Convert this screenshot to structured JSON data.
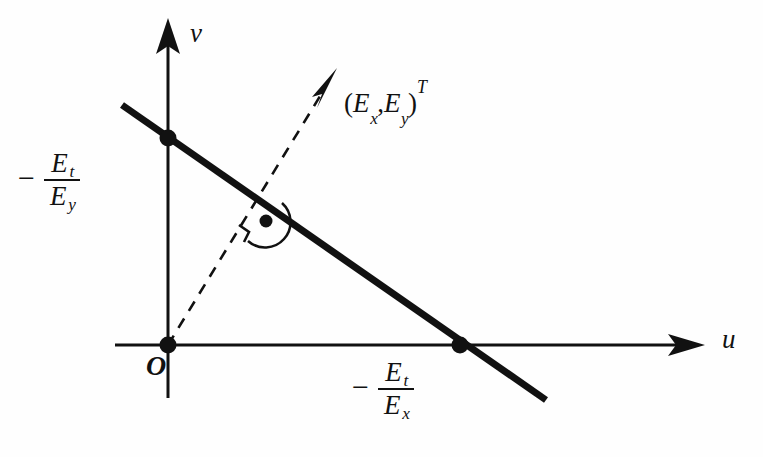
{
  "figure": {
    "type": "diagram",
    "background_color": "#fefefe",
    "ink_color": "#111111"
  },
  "axes": {
    "horizontal": {
      "name": "u",
      "arrow": "right",
      "y_pixel": 345,
      "x_start": 115,
      "x_end": 705,
      "label_position": {
        "x": 722,
        "y": 326
      }
    },
    "vertical": {
      "name": "v",
      "arrow": "up",
      "x_pixel": 168,
      "y_top": 18,
      "y_bottom": 398,
      "label_position": {
        "x": 190,
        "y": 20
      }
    },
    "origin": {
      "label": "O",
      "x": 168,
      "y": 345
    }
  },
  "constraint_line": {
    "name": "optical-flow-constraint-line",
    "style": "solid-thick",
    "stroke_width": 7,
    "x1": 122,
    "y1": 105,
    "x2": 546,
    "y2": 400,
    "slope": -0.696,
    "v_intercept": {
      "x": 168,
      "y": 138
    },
    "u_intercept": {
      "x": 460,
      "y": 345
    }
  },
  "gradient_vector": {
    "name": "gradient-vector",
    "style": "dashed-arrow",
    "from": {
      "x": 168,
      "y": 345
    },
    "to": {
      "x": 337,
      "y": 68
    },
    "label": {
      "open_paren": "(",
      "first": "E",
      "first_sub": "x",
      "comma": ",",
      "second": "E",
      "second_sub": "y",
      "close_paren": ")",
      "transpose": "T"
    }
  },
  "right_angle_marker": {
    "name": "perpendicular-marker",
    "center": {
      "x": 265,
      "y": 222
    },
    "note": "arc with square corner tick and dot indicating 90 degrees"
  },
  "labels": {
    "v_intercept": {
      "minus": "−",
      "numerator": "E",
      "numerator_sub": "t",
      "denominator": "E",
      "denominator_sub": "y"
    },
    "u_intercept": {
      "minus": "−",
      "numerator": "E",
      "numerator_sub": "t",
      "denominator": "E",
      "denominator_sub": "x"
    }
  },
  "points": [
    {
      "name": "origin-point",
      "x": 168,
      "y": 345,
      "radius": 8
    },
    {
      "name": "v-intercept-point",
      "x": 168,
      "y": 138,
      "radius": 8
    },
    {
      "name": "u-intercept-point",
      "x": 460,
      "y": 345,
      "radius": 8
    }
  ]
}
